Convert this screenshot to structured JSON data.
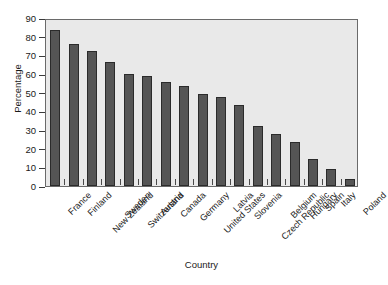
{
  "chart_data": {
    "type": "bar",
    "title": "",
    "xlabel": "Country",
    "ylabel": "Percentage",
    "categories": [
      "France",
      "Finland",
      "New Zealand",
      "Sweden",
      "Switzerland",
      "Austria",
      "Canada",
      "Germany",
      "United States",
      "Latvia",
      "Slovenia",
      "Czech Republic",
      "Belgium",
      "Hungary",
      "Spain",
      "Italy",
      "Poland"
    ],
    "values": [
      83.5,
      76,
      72.5,
      66.5,
      60,
      59,
      55.5,
      53.5,
      49.5,
      47.5,
      43.5,
      32,
      28,
      23.5,
      14.5,
      9,
      4
    ],
    "ylim": [
      0,
      90
    ],
    "yticks": [
      0,
      10,
      20,
      30,
      40,
      50,
      60,
      70,
      80,
      90
    ],
    "ytick_labels": [
      "0",
      "10",
      "20",
      "30",
      "40",
      "50",
      "60",
      "70",
      "80",
      "90"
    ],
    "grid": false,
    "legend": false,
    "bar_color": "#555555",
    "bar_edge_color": "#2b2b2b",
    "plot_background": "#e9e9e9",
    "figure_background": "#ffffff",
    "axis_color": "#6a6a6a"
  }
}
